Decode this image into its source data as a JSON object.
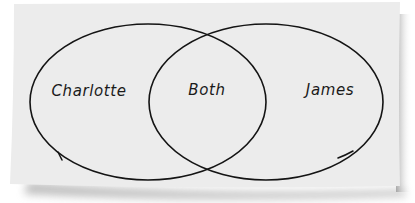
{
  "diagram": {
    "type": "venn",
    "sets": [
      {
        "id": "left",
        "label": "Charlotte"
      },
      {
        "id": "right",
        "label": "James"
      }
    ],
    "intersection": {
      "label": "Both"
    }
  },
  "colors": {
    "paper": "#ececec",
    "stroke": "#141414",
    "shadow": "#9a9a9a",
    "text": "#1a1a1a"
  }
}
